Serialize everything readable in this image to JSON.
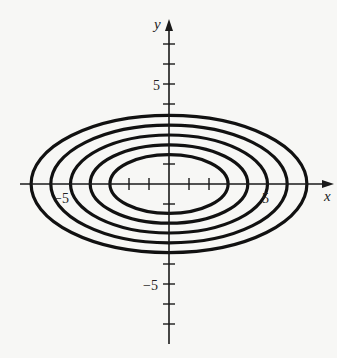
{
  "chart_data": {
    "type": "line",
    "title": "",
    "xlabel": "x",
    "ylabel": "y",
    "xlim": [
      -8,
      8
    ],
    "ylim": [
      -8,
      8
    ],
    "grid": false,
    "legend": null,
    "x_tick_labels": [
      {
        "value": -5,
        "label": "−5"
      },
      {
        "value": 5,
        "label": "5"
      }
    ],
    "y_tick_labels": [
      {
        "value": 5,
        "label": "5"
      },
      {
        "value": -5,
        "label": "−5"
      }
    ],
    "x_ticks": [
      -2,
      -1,
      1,
      2
    ],
    "y_ticks": [
      -7,
      -6,
      -5,
      -4,
      -1,
      1,
      4,
      5,
      6,
      7
    ],
    "series": [
      {
        "name": "ellipse 1",
        "center": [
          0,
          0
        ],
        "semi_major_x": 3,
        "semi_minor_y": 1.5
      },
      {
        "name": "ellipse 2",
        "center": [
          0,
          0
        ],
        "semi_major_x": 4,
        "semi_minor_y": 2
      },
      {
        "name": "ellipse 3",
        "center": [
          0,
          0
        ],
        "semi_major_x": 5,
        "semi_minor_y": 2.5
      },
      {
        "name": "ellipse 4",
        "center": [
          0,
          0
        ],
        "semi_major_x": 6,
        "semi_minor_y": 3
      },
      {
        "name": "ellipse 5",
        "center": [
          0,
          0
        ],
        "semi_major_x": 7,
        "semi_minor_y": 3.5
      }
    ]
  },
  "labels": {
    "x_axis": "x",
    "y_axis": "y",
    "x_neg5": "−5",
    "x_pos5": "5",
    "y_pos5": "5",
    "y_neg5": "−5"
  }
}
